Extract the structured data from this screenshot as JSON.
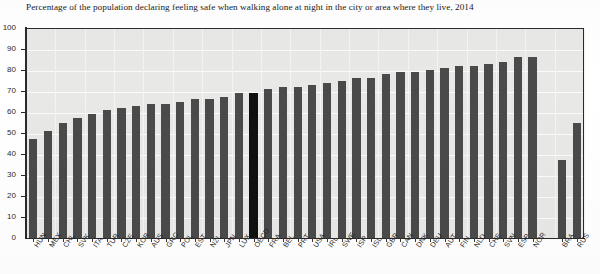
{
  "chart_data": {
    "type": "bar",
    "title": "Percentage of the population declaring feeling safe when walking alone at night in the city or area where they live, 2014",
    "xlabel": "",
    "ylabel": "",
    "ylim": [
      0,
      100
    ],
    "ytick_step": 10,
    "yticks": [
      100,
      90,
      80,
      70,
      60,
      50,
      40,
      30,
      20,
      10,
      0
    ],
    "grid": true,
    "legend": "none",
    "highlight_category": "OECD",
    "highlight_color": "#101010",
    "bar_color": "#4a4a4a",
    "plot_background": "#e8e8e6",
    "gap_after_category": "NOR",
    "categories": [
      "HUN",
      "MEX",
      "CHL",
      "SVK",
      "ITA",
      "TUR",
      "CZE",
      "KOR",
      "AUS",
      "GRC",
      "POL",
      "EST",
      "NZL",
      "JPN",
      "LUX",
      "OECD",
      "FRA",
      "BEL",
      "PRT",
      "USA",
      "IRL",
      "SWE",
      "ISR",
      "ISL",
      "GBR",
      "CAN",
      "DNK",
      "DEU",
      "AUT",
      "FIN",
      "NLD",
      "CHE",
      "SVN",
      "ESP",
      "NOR",
      "BRA",
      "RUS"
    ],
    "values": [
      47,
      51,
      55,
      57,
      59,
      61,
      62,
      63,
      64,
      64,
      65,
      66,
      66,
      67,
      69,
      69,
      71,
      72,
      72,
      73,
      74,
      75,
      76,
      76,
      78,
      79,
      79,
      80,
      81,
      82,
      82,
      83,
      84,
      86,
      86,
      37,
      55
    ]
  }
}
